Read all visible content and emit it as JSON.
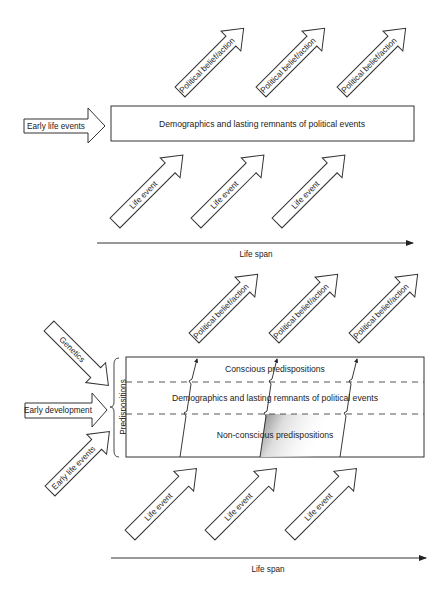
{
  "top_panel": {
    "input_arrow": "Early life events",
    "box_label": "Demographics and lasting remnants of political events",
    "output_arrows": [
      "Political belief/action",
      "Political belief/action",
      "Political belief/action"
    ],
    "event_arrows": [
      "Life event",
      "Life event",
      "Life event"
    ],
    "axis_label": "Life span"
  },
  "bottom_panel": {
    "input_arrows": [
      "Genetics",
      "Early development",
      "Early life events"
    ],
    "brace_label": "Predispositions",
    "layers": [
      "Conscious predispositions",
      "Demographics and lasting remnants of political events",
      "Non-conscious predispositions"
    ],
    "output_arrows": [
      "Political belief/action",
      "Political belief/action",
      "Political belief/action"
    ],
    "event_arrows": [
      "Life event",
      "Life event",
      "Life event"
    ],
    "axis_label": "Life span"
  }
}
